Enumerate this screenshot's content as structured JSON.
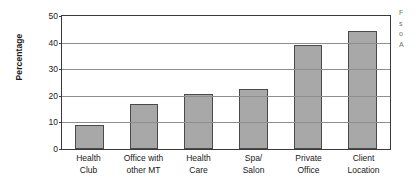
{
  "chart_data": {
    "type": "bar",
    "title": "",
    "xlabel": "",
    "ylabel": "Percentage",
    "ylim": [
      0,
      50
    ],
    "ytick_values": [
      0,
      10,
      20,
      30,
      40,
      50
    ],
    "ytick_labels": [
      "0",
      "10",
      "20",
      "30",
      "40",
      "50"
    ],
    "grid": "horizontal",
    "legend": "none",
    "bar_color": "#a8a8a8",
    "bar_edge_color": "#4a4a4a",
    "categories": [
      "Health Club",
      "Office with other MT",
      "Health Care",
      "Spa/ Salon",
      "Private Office",
      "Client Location"
    ],
    "category_lines": [
      [
        "Health",
        "Club"
      ],
      [
        "Office with",
        "other MT"
      ],
      [
        "Health",
        "Care"
      ],
      [
        "Spa/",
        "Salon"
      ],
      [
        "Private",
        "Office"
      ],
      [
        "Client",
        "Location"
      ]
    ],
    "values": [
      9,
      17,
      20.5,
      22.5,
      39,
      44.5
    ]
  },
  "side_note": {
    "lines": [
      "F",
      "s",
      "o",
      "A"
    ]
  }
}
